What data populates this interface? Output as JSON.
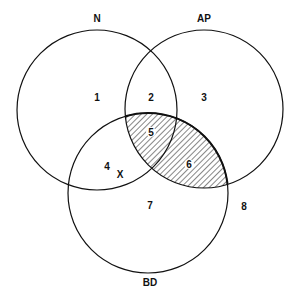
{
  "diagram": {
    "type": "venn",
    "sets": [
      {
        "id": "N",
        "label": "N",
        "cx": 97,
        "cy": 110,
        "r": 80,
        "label_x": 97,
        "label_y": 22
      },
      {
        "id": "AP",
        "label": "AP",
        "cx": 204,
        "cy": 109,
        "r": 79,
        "label_x": 204,
        "label_y": 22
      },
      {
        "id": "BD",
        "label": "BD",
        "cx": 148,
        "cy": 193,
        "r": 80,
        "label_x": 150,
        "label_y": 286
      }
    ],
    "regions": [
      {
        "label": "1",
        "x": 97,
        "y": 101
      },
      {
        "label": "2",
        "x": 151,
        "y": 101
      },
      {
        "label": "3",
        "x": 204,
        "y": 101
      },
      {
        "label": "4",
        "x": 107,
        "y": 170
      },
      {
        "label": "5",
        "x": 151,
        "y": 136
      },
      {
        "label": "6",
        "x": 189,
        "y": 168
      },
      {
        "label": "7",
        "x": 150,
        "y": 209
      },
      {
        "label": "8",
        "x": 244,
        "y": 210
      }
    ],
    "marker": {
      "label": "X",
      "x": 120,
      "y": 178
    },
    "shaded_region": "AP ∩ BD (regions 5 and 6)",
    "colors": {
      "stroke": "#111111",
      "hatch": "#222222",
      "background": "#ffffff"
    }
  }
}
